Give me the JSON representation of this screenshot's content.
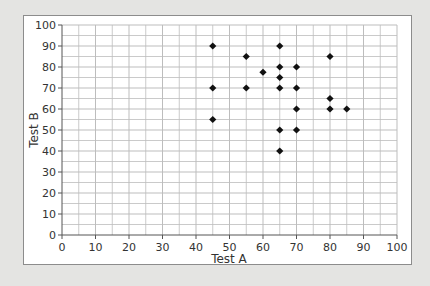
{
  "chart_data": {
    "type": "scatter",
    "title": "",
    "xlabel": "Test A",
    "ylabel": "Test B",
    "xlim": [
      0,
      100
    ],
    "ylim": [
      0,
      100
    ],
    "x_ticks": [
      0,
      10,
      20,
      30,
      40,
      50,
      60,
      70,
      80,
      90,
      100
    ],
    "y_ticks": [
      0,
      10,
      20,
      30,
      40,
      50,
      60,
      70,
      80,
      90,
      100
    ],
    "grid": true,
    "grid_minor_step": 5,
    "legend": null,
    "marker": "diamond",
    "marker_color": "#111111",
    "series": [
      {
        "name": "Scores",
        "points": [
          {
            "x": 45,
            "y": 90
          },
          {
            "x": 45,
            "y": 70
          },
          {
            "x": 45,
            "y": 55
          },
          {
            "x": 55,
            "y": 85
          },
          {
            "x": 55,
            "y": 70
          },
          {
            "x": 60,
            "y": 77.5
          },
          {
            "x": 65,
            "y": 90
          },
          {
            "x": 65,
            "y": 80
          },
          {
            "x": 65,
            "y": 75
          },
          {
            "x": 65,
            "y": 70
          },
          {
            "x": 65,
            "y": 50
          },
          {
            "x": 65,
            "y": 40
          },
          {
            "x": 70,
            "y": 80
          },
          {
            "x": 70,
            "y": 70
          },
          {
            "x": 70,
            "y": 60
          },
          {
            "x": 70,
            "y": 50
          },
          {
            "x": 80,
            "y": 85
          },
          {
            "x": 80,
            "y": 65
          },
          {
            "x": 80,
            "y": 60
          },
          {
            "x": 85,
            "y": 60
          }
        ]
      }
    ]
  },
  "colors": {
    "background": "#e4e4e2",
    "panel": "#ffffff",
    "grid": "#bdbdbd",
    "axis": "#555555",
    "marker": "#111111"
  }
}
